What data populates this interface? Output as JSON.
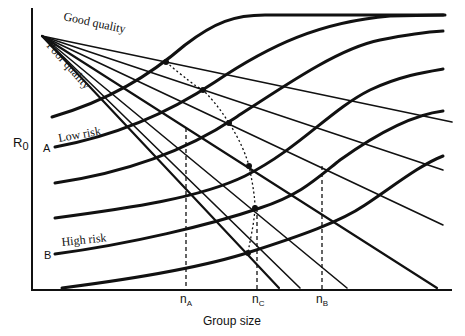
{
  "figure": {
    "y_axis_label": "R",
    "y_axis_subscript": "0",
    "x_axis_label": "Group size",
    "ray_labels": {
      "top": "Good quality",
      "bottom": "Poor quality"
    },
    "curve_labels": {
      "upper": "Low risk",
      "lower": "High risk"
    },
    "curve_markers": {
      "upper": "A",
      "lower": "B"
    },
    "tick_labels": [
      {
        "main": "n",
        "sub": "A"
      },
      {
        "main": "n",
        "sub": "C"
      },
      {
        "main": "n",
        "sub": "B"
      }
    ],
    "colors": {
      "ink": "#111111",
      "background": "#ffffff"
    }
  }
}
